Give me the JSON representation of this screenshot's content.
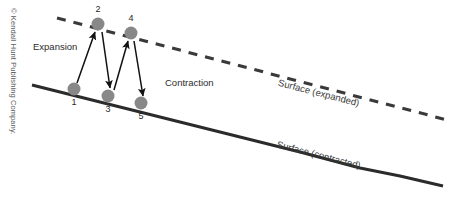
{
  "figure": {
    "type": "diagram",
    "background_color": "#ffffff"
  },
  "credit": {
    "text": "© Kendall Hunt Publishing Company.",
    "orientation": "vertical-rotated-90",
    "color": "#5a5a5a"
  },
  "labels": {
    "expansion": "Expansion",
    "contraction": "Contraction",
    "surface_expanded": "Surface (expanded)",
    "surface_contracted": "Surface (contracted)"
  },
  "lines": [
    {
      "name": "surface-expanded-line",
      "style": "dashed",
      "label": "Surface (expanded)",
      "color": "#3a3a3a",
      "x1": 57,
      "y1": 18,
      "x2": 451,
      "y2": 121
    },
    {
      "name": "surface-contracted-line",
      "style": "solid",
      "label": "Surface (contracted)",
      "color": "#2b2b2b",
      "x1": 32,
      "y1": 85,
      "x2": 443,
      "y2": 186
    }
  ],
  "markers": [
    {
      "id": "1",
      "label": "1",
      "x": 74,
      "y": 89,
      "on": "surface-contracted-line",
      "label_dx": 0,
      "label_dy": 16
    },
    {
      "id": "2",
      "label": "2",
      "x": 98,
      "y": 24,
      "on": "surface-expanded-line",
      "label_dx": 0,
      "label_dy": -12
    },
    {
      "id": "3",
      "label": "3",
      "x": 108,
      "y": 96,
      "on": "surface-contracted-line",
      "label_dx": 0,
      "label_dy": 16
    },
    {
      "id": "4",
      "label": "4",
      "x": 131,
      "y": 33,
      "on": "surface-expanded-line",
      "label_dx": 0,
      "label_dy": -12
    },
    {
      "id": "5",
      "label": "5",
      "x": 141,
      "y": 103,
      "on": "surface-contracted-line",
      "label_dx": 0,
      "label_dy": 16
    }
  ],
  "marker_style": {
    "fill": "#888888",
    "radius": 6.5
  },
  "arrows": [
    {
      "name": "arrow-1-to-2",
      "from": "1",
      "to": "2",
      "direction": "up",
      "phase": "Expansion",
      "x1": 77,
      "y1": 83,
      "x2": 95,
      "y2": 32
    },
    {
      "name": "arrow-2-to-3",
      "from": "2",
      "to": "3",
      "direction": "down",
      "phase": "Contraction",
      "x1": 102,
      "y1": 32,
      "x2": 110,
      "y2": 88
    },
    {
      "name": "arrow-3-to-4",
      "from": "3",
      "to": "4",
      "direction": "up",
      "phase": "Expansion",
      "x1": 114,
      "y1": 90,
      "x2": 128,
      "y2": 41
    },
    {
      "name": "arrow-4-to-5",
      "from": "4",
      "to": "5",
      "direction": "down",
      "phase": "Contraction",
      "x1": 134,
      "y1": 41,
      "x2": 143,
      "y2": 96
    }
  ],
  "text_positions": {
    "expansion": {
      "x": 33,
      "y": 50,
      "rotate": 0
    },
    "contraction": {
      "x": 165,
      "y": 86,
      "rotate": 0
    },
    "surface_expanded": {
      "x": 318,
      "y": 96,
      "rotate": 14.5
    },
    "surface_contracted": {
      "x": 318,
      "y": 158,
      "rotate": 14.5
    },
    "credit": {
      "x": 11,
      "y": 8,
      "rotate": 90
    }
  }
}
